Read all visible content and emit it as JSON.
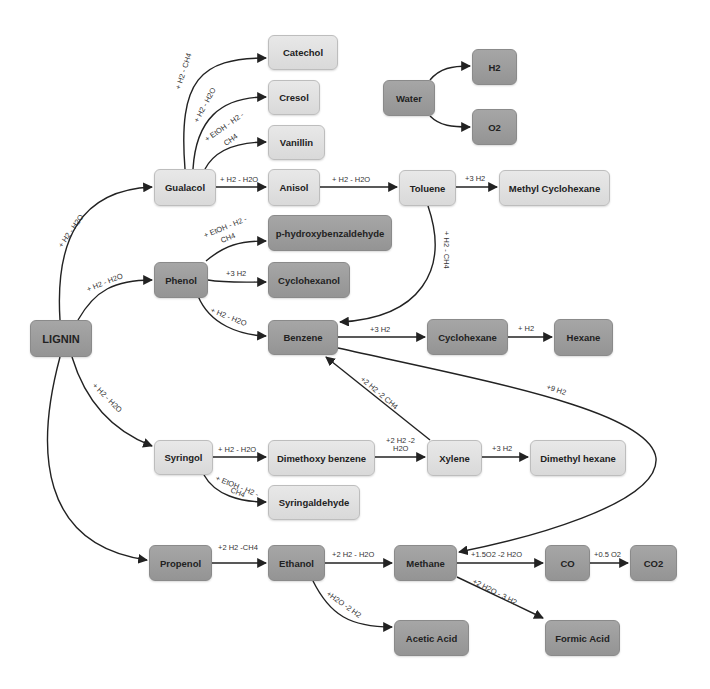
{
  "diagram": {
    "colors": {
      "light_node": "#dedede",
      "dark_node": "#9d9d9d",
      "edge": "#222222",
      "background": "#ffffff"
    },
    "nodes": {
      "lignin": "LIGNIN",
      "guaiacol": "Gualacol",
      "phenol": "Phenol",
      "syringol": "Syringol",
      "propenol": "Propenol",
      "catechol": "Catechol",
      "cresol": "Cresol",
      "vanillin": "Vanillin",
      "anisol": "Anisol",
      "toluene": "Toluene",
      "methyl_cyclohexane": "Methyl Cyclohexane",
      "p_hydroxybenzaldehyde": "p-hydroxybenzaldehyde",
      "cyclohexanol": "Cyclohexanol",
      "benzene": "Benzene",
      "cyclohexane": "Cyclohexane",
      "hexane": "Hexane",
      "dimethoxy_benzene": "Dimethoxy benzene",
      "syringaldehyde": "Syringaldehyde",
      "xylene": "Xylene",
      "dimethyl_hexane": "Dimethyl hexane",
      "ethanol": "Ethanol",
      "methane": "Methane",
      "co": "CO",
      "co2": "CO2",
      "acetic_acid": "Acetic Acid",
      "formic_acid": "Formic Acid",
      "water": "Water",
      "h2": "H2",
      "o2": "O2"
    },
    "edges": {
      "lignin_guaiacol": "+ H2 - H2O",
      "lignin_phenol": "+ H2 - H2O",
      "lignin_syringol": "+ H2 - H2O",
      "guaiacol_catechol": "+ H2 - CH4",
      "guaiacol_cresol": "+ H2 - H2O",
      "guaiacol_vanillin_1": "+ EtOH - H2 -",
      "guaiacol_vanillin_2": "CH4",
      "guaiacol_anisol": "+ H2 - H2O",
      "anisol_toluene": "+ H2 - H2O",
      "toluene_methylcyclohexane": "+3 H2",
      "toluene_benzene": "+ H2 - CH4",
      "phenol_phydroxy_1": "+ EtOH - H2 -",
      "phenol_phydroxy_2": "CH4",
      "phenol_cyclohexanol": "+3 H2",
      "phenol_benzene": "+ H2 - H2O",
      "benzene_cyclohexane": "+3 H2",
      "cyclohexane_hexane": "+ H2",
      "benzene_methane": "+9 H2",
      "xylene_benzene": "+2 H2 -2 CH4",
      "syringol_dimethoxy": "+ H2 - H2O",
      "syringol_syringaldehyde_1": "+ EtOH - H2 -",
      "syringol_syringaldehyde_2": "CH4",
      "dimethoxy_xylene_1": "+2 H2 -2",
      "dimethoxy_xylene_2": "H2O",
      "xylene_dimethylhexane": "+3 H2",
      "propenol_ethanol": "+2 H2 -CH4",
      "ethanol_methane": "+2 H2 - H2O",
      "ethanol_acetic": "+H2O -2 H2",
      "methane_co": "+1.5O2 -2 H2O",
      "co_co2": "+0.5 O2",
      "methane_formic": "+2 H2O - 3 H2"
    }
  }
}
